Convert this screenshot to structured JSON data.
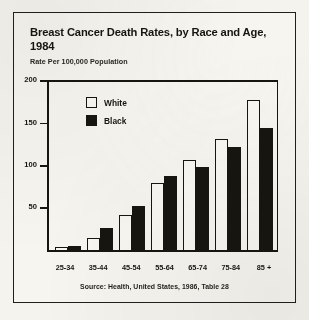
{
  "figure": {
    "title": "Breast Cancer Death Rates, by Race and Age, 1984",
    "subtitle": "Rate Per 100,000 Population",
    "source": "Source: Health, United States, 1986,  Table 28",
    "ink_color": "#17150f",
    "paper_color": "#f4f3ee"
  },
  "chart_data": {
    "type": "bar",
    "title": "Breast Cancer Death Rates, by Race and Age, 1984",
    "subtitle": "Rate Per 100,000 Population",
    "xlabel": "",
    "ylabel": "Rate Per 100,000 Population",
    "ylim": [
      0,
      200
    ],
    "yticks": [
      50,
      100,
      150,
      200
    ],
    "ytick_labels": [
      "50",
      "100",
      "150",
      "200"
    ],
    "grid": false,
    "legend_position": "inside-top-left",
    "categories": [
      "25-34",
      "35-44",
      "45-54",
      "55-64",
      "65-74",
      "75-84",
      "85 +"
    ],
    "series": [
      {
        "name": "White",
        "color": "#f8f7f2",
        "values": [
          3,
          14,
          42,
          79,
          107,
          131,
          178
        ]
      },
      {
        "name": "Black",
        "color": "#17150f",
        "values": [
          5,
          26,
          52,
          88,
          98,
          122,
          144
        ]
      }
    ],
    "annotations": [
      "Source: Health, United States, 1986,  Table 28"
    ]
  }
}
